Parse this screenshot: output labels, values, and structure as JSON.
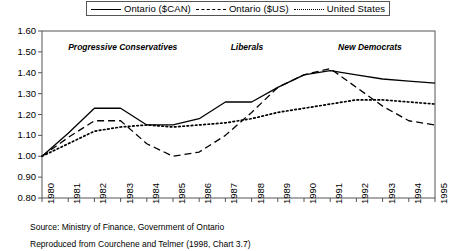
{
  "legend": {
    "position": "top-center",
    "entries": [
      {
        "label": "Ontario ($CAN)",
        "style": "solid",
        "icon": "line-solid-icon"
      },
      {
        "label": "Ontario ($US)",
        "style": "dashed",
        "icon": "line-dashed-icon"
      },
      {
        "label": "United States",
        "style": "dotted",
        "icon": "line-dotted-icon"
      }
    ]
  },
  "annotations": [
    {
      "text": "Progressive Conservatives",
      "x": 1981.0,
      "y": 1.525
    },
    {
      "text": "Liberals",
      "x": 1987.2,
      "y": 1.525
    },
    {
      "text": "New Democrats",
      "x": 1991.3,
      "y": 1.525
    }
  ],
  "notes": {
    "source": "Source: Ministry of Finance, Government of Ontario",
    "reproduced": "Reproduced from Courchene and Telmer (1998, Chart 3.7)"
  },
  "chart_data": {
    "type": "line",
    "title": "",
    "subtitle": "",
    "xlabel": "",
    "ylabel": "",
    "grid": false,
    "xlim": [
      1980,
      1995
    ],
    "ylim": [
      0.8,
      1.6
    ],
    "yticks": [
      "0.80",
      "0.90",
      "1.00",
      "1.10",
      "1.20",
      "1.30",
      "1.40",
      "1.50",
      "1.60"
    ],
    "ytick_values": [
      0.8,
      0.9,
      1.0,
      1.1,
      1.2,
      1.3,
      1.4,
      1.5,
      1.6
    ],
    "x": [
      1980,
      1981,
      1982,
      1983,
      1984,
      1985,
      1986,
      1987,
      1988,
      1989,
      1990,
      1991,
      1992,
      1993,
      1994,
      1995
    ],
    "xticks": [
      "1980",
      "1981",
      "1982",
      "1983",
      "1984",
      "1985",
      "1986",
      "1987",
      "1988",
      "1989",
      "1990",
      "1991",
      "1992",
      "1993",
      "1994",
      "1995"
    ],
    "series": [
      {
        "name": "Ontario ($CAN)",
        "style": "solid",
        "color": "#000000",
        "values": [
          1.0,
          1.11,
          1.23,
          1.23,
          1.15,
          1.15,
          1.18,
          1.26,
          1.26,
          1.33,
          1.39,
          1.41,
          1.39,
          1.37,
          1.36,
          1.35
        ]
      },
      {
        "name": "Ontario ($US)",
        "style": "dashed",
        "color": "#000000",
        "values": [
          1.0,
          1.09,
          1.17,
          1.17,
          1.06,
          1.0,
          1.02,
          1.1,
          1.21,
          1.33,
          1.39,
          1.42,
          1.33,
          1.24,
          1.17,
          1.15
        ]
      },
      {
        "name": "United States",
        "style": "dotted",
        "color": "#000000",
        "values": [
          1.0,
          1.06,
          1.12,
          1.14,
          1.15,
          1.14,
          1.15,
          1.16,
          1.18,
          1.21,
          1.23,
          1.25,
          1.27,
          1.27,
          1.26,
          1.25
        ]
      }
    ]
  }
}
